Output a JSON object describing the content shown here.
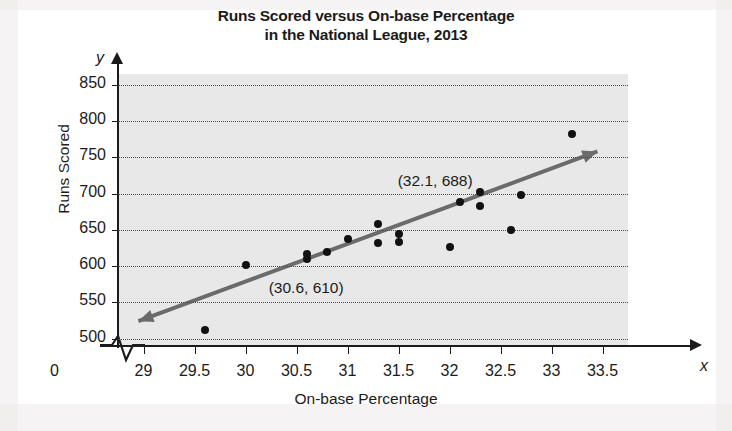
{
  "chart_data": {
    "type": "scatter",
    "title": "Runs Scored versus On-base Percentage in the National League, 2013",
    "title_line1": "Runs Scored versus On-base Percentage",
    "title_line2": "in the National League, 2013",
    "xlabel": "On-base Percentage",
    "ylabel": "Runs Scored",
    "x_axis_letter": "x",
    "y_axis_letter": "y",
    "origin_label": "0",
    "axis_break": true,
    "grid": true,
    "grid_style": "horizontal-dotted",
    "xlim": [
      28.75,
      33.75
    ],
    "ylim": [
      490,
      865
    ],
    "xticks": [
      "29",
      "29.5",
      "30",
      "30.5",
      "31",
      "31.5",
      "32",
      "32.5",
      "33",
      "33.5"
    ],
    "xtick_values": [
      29,
      29.5,
      30,
      30.5,
      31,
      31.5,
      32,
      32.5,
      33,
      33.5
    ],
    "yticks": [
      "500",
      "550",
      "600",
      "650",
      "700",
      "750",
      "800",
      "850"
    ],
    "ytick_values": [
      500,
      550,
      600,
      650,
      700,
      750,
      800,
      850
    ],
    "points": [
      {
        "x": 29.6,
        "y": 512
      },
      {
        "x": 30.0,
        "y": 601
      },
      {
        "x": 30.6,
        "y": 617
      },
      {
        "x": 30.6,
        "y": 610
      },
      {
        "x": 30.8,
        "y": 619
      },
      {
        "x": 31.0,
        "y": 638
      },
      {
        "x": 31.3,
        "y": 658
      },
      {
        "x": 31.3,
        "y": 632
      },
      {
        "x": 31.5,
        "y": 645
      },
      {
        "x": 31.5,
        "y": 633
      },
      {
        "x": 32.0,
        "y": 627
      },
      {
        "x": 32.1,
        "y": 688
      },
      {
        "x": 32.3,
        "y": 703
      },
      {
        "x": 32.3,
        "y": 683
      },
      {
        "x": 32.6,
        "y": 650
      },
      {
        "x": 32.7,
        "y": 698
      },
      {
        "x": 33.2,
        "y": 782
      }
    ],
    "trend_line": {
      "label": "line of best fit",
      "point_a": {
        "x": 30.6,
        "y": 610
      },
      "point_b": {
        "x": 32.1,
        "y": 688
      },
      "x_start": 28.95,
      "x_end": 33.45,
      "color": "#6b6b6b",
      "double_arrow": true
    },
    "annotations": [
      {
        "text": "(32.1, 688)",
        "x": 32.1,
        "y": 688
      },
      {
        "text": "(30.6, 610)",
        "x": 30.6,
        "y": 610
      }
    ],
    "colors": {
      "plot_background": "#e8e8e8",
      "point": "#111111",
      "axis": "#1b1b1b",
      "grid": "#4a4a4a",
      "trend": "#6b6b6b"
    }
  }
}
